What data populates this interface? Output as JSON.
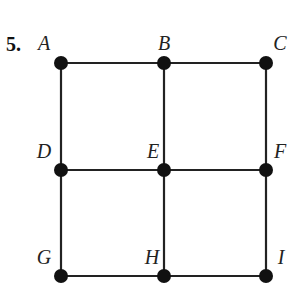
{
  "problem_number": "5.",
  "nodes": [
    {
      "id": "A",
      "label": "A",
      "x": 61,
      "y": 63,
      "lx": 44,
      "ly": 50
    },
    {
      "id": "B",
      "label": "B",
      "x": 164,
      "y": 63,
      "lx": 164,
      "ly": 50
    },
    {
      "id": "C",
      "label": "C",
      "x": 266,
      "y": 63,
      "lx": 280,
      "ly": 50
    },
    {
      "id": "D",
      "label": "D",
      "x": 61,
      "y": 170,
      "lx": 44,
      "ly": 158
    },
    {
      "id": "E",
      "label": "E",
      "x": 164,
      "y": 170,
      "lx": 153,
      "ly": 158
    },
    {
      "id": "F",
      "label": "F",
      "x": 266,
      "y": 170,
      "lx": 280,
      "ly": 158
    },
    {
      "id": "G",
      "label": "G",
      "x": 61,
      "y": 276,
      "lx": 44,
      "ly": 264
    },
    {
      "id": "H",
      "label": "H",
      "x": 164,
      "y": 276,
      "lx": 152,
      "ly": 264
    },
    {
      "id": "I",
      "label": "I",
      "x": 266,
      "y": 276,
      "lx": 281,
      "ly": 264
    }
  ],
  "edges": [
    [
      "A",
      "B"
    ],
    [
      "B",
      "C"
    ],
    [
      "D",
      "E"
    ],
    [
      "E",
      "F"
    ],
    [
      "G",
      "H"
    ],
    [
      "H",
      "I"
    ],
    [
      "A",
      "D"
    ],
    [
      "D",
      "G"
    ],
    [
      "B",
      "E"
    ],
    [
      "E",
      "H"
    ],
    [
      "C",
      "F"
    ],
    [
      "F",
      "I"
    ]
  ]
}
